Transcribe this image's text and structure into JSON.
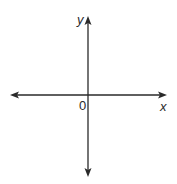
{
  "diagram": {
    "type": "cartesian-axes",
    "x_axis": {
      "label": "x",
      "direction": "bidirectional"
    },
    "y_axis": {
      "label": "y",
      "direction": "bidirectional"
    },
    "origin": {
      "label": "0"
    },
    "colors": {
      "line": "#2a2a2a",
      "background": "#ffffff"
    }
  }
}
